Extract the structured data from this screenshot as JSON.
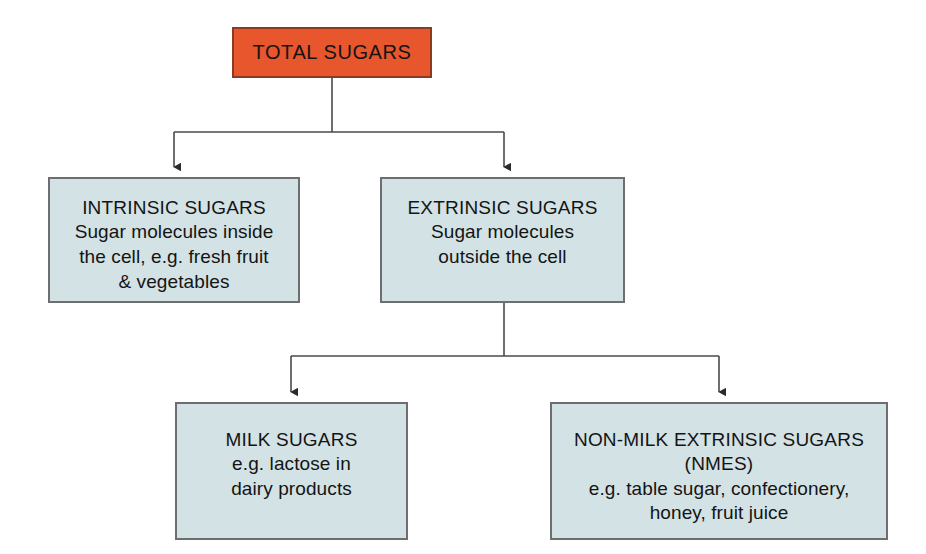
{
  "diagram": {
    "type": "hierarchy-flowchart",
    "colors": {
      "root_fill": "#e8562e",
      "root_border": "#8c3a22",
      "branch_fill": "#d3e2e4",
      "branch_border": "#6d6e70",
      "connector": "#4a4a4a",
      "text": "#141414",
      "background": "#ffffff"
    },
    "nodes": {
      "total_sugars": {
        "title": "TOTAL SUGARS",
        "description": ""
      },
      "intrinsic_sugars": {
        "title": "INTRINSIC SUGARS",
        "description": "Sugar molecules inside\nthe cell, e.g. fresh fruit\n& vegetables"
      },
      "extrinsic_sugars": {
        "title": "EXTRINSIC SUGARS",
        "description": "Sugar molecules\noutside the cell"
      },
      "milk_sugars": {
        "title": "MILK SUGARS",
        "description": "e.g. lactose in\ndairy products"
      },
      "nmes": {
        "title": "NON-MILK EXTRINSIC SUGARS\n(NMES)",
        "description": "e.g. table sugar, confectionery,\nhoney, fruit juice"
      }
    },
    "edges": [
      {
        "from": "total_sugars",
        "to": "intrinsic_sugars"
      },
      {
        "from": "total_sugars",
        "to": "extrinsic_sugars"
      },
      {
        "from": "extrinsic_sugars",
        "to": "milk_sugars"
      },
      {
        "from": "extrinsic_sugars",
        "to": "nmes"
      }
    ]
  }
}
